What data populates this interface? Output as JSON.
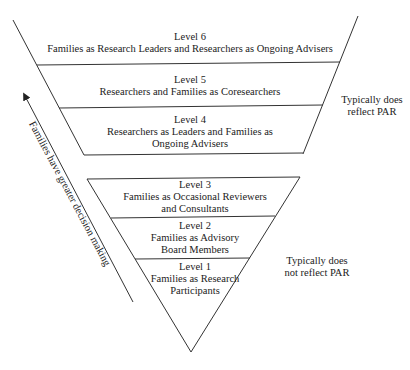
{
  "levels": [
    {
      "title": "Level 6",
      "lines": [
        "Families as Research Leaders and Researchers as Ongoing Advisers"
      ]
    },
    {
      "title": "Level 5",
      "lines": [
        "Researchers and Families as Coresearchers"
      ]
    },
    {
      "title": "Level 4",
      "lines": [
        "Researchers as Leaders and Families as",
        "Ongoing Advisers"
      ]
    },
    {
      "title": "Level 3",
      "lines": [
        "Families as Occasional Reviewers",
        "and Consultants"
      ]
    },
    {
      "title": "Level 2",
      "lines": [
        "Families as Advisory",
        "Board Members"
      ]
    },
    {
      "title": "Level 1",
      "lines": [
        "Families as Research",
        "Participants"
      ]
    }
  ],
  "side_labels": {
    "upper": [
      "Typically does",
      "reflect PAR"
    ],
    "lower": [
      "Typically does",
      "not reflect PAR"
    ]
  },
  "arrow_label": "Families have greater decision making"
}
